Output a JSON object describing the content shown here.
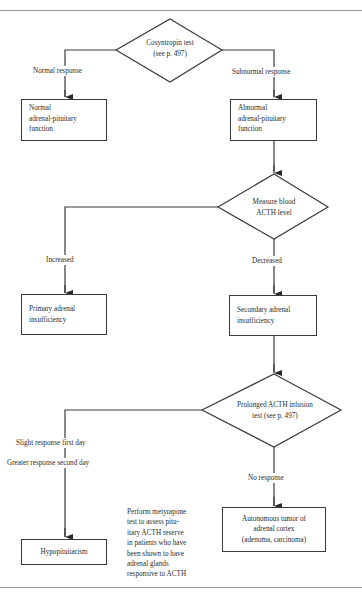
{
  "diagram": {
    "type": "flowchart",
    "nodes": {
      "cosyntropin": {
        "line1": "Cosyntropin test",
        "line2": "(see p. 497)",
        "shape": "diamond"
      },
      "normal_function": {
        "line1": "Normal",
        "line2": "adrenal-pituitary",
        "line3": "function",
        "shape": "box"
      },
      "abnormal_function": {
        "line1": "Abnormal",
        "line2": "adrenal-pituitary",
        "line3": "function",
        "shape": "box"
      },
      "measure_acth": {
        "line1": "Measure blood",
        "line2": "ACTH level",
        "shape": "diamond"
      },
      "primary": {
        "line1": "Primary adrenal",
        "line2": "insufficiency",
        "shape": "box"
      },
      "secondary": {
        "line1": "Secondary adrenal",
        "line2": "insufficiency",
        "shape": "box"
      },
      "infusion": {
        "line1": "Prolonged ACTH infusion",
        "line2": "test (see p. 497)",
        "shape": "diamond"
      },
      "hypopituitarism": {
        "line1": "Hypopituitarism",
        "shape": "box"
      },
      "tumor": {
        "line1": "Autonomous tumor of",
        "line2": "adrenal cortex",
        "line3": "(adenoma, carcinoma)",
        "shape": "box"
      }
    },
    "edges": {
      "normal_response": "Normal response",
      "subnormal_response": "Subnormal response",
      "increased": "Increased",
      "decreased": "Decreased",
      "slight_first_day": "Slight response first day",
      "greater_second_day": "Greater response second day",
      "no_response": "No response"
    },
    "note": {
      "lines": [
        "Perform metyrapone",
        "test to assess pitu-",
        "itary ACTH reserve",
        "in patients who have",
        "been shown to have",
        "adrenal glands",
        "responsive to ACTH"
      ]
    }
  }
}
